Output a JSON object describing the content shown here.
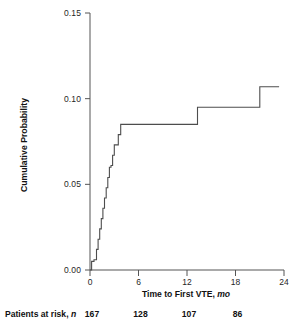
{
  "chart_data": {
    "type": "line",
    "subtype": "kaplan-meier-cumulative-incidence",
    "title": "",
    "xlabel": "Time to First VTE, mo",
    "xlabel_main": "Time to First VTE,",
    "xlabel_unit": "mo",
    "ylabel": "Cumulative Probability",
    "xlim": [
      0,
      24
    ],
    "ylim": [
      0.0,
      0.15
    ],
    "xticks": [
      0,
      6,
      12,
      18,
      24
    ],
    "xticklabels": [
      "0",
      "6",
      "12",
      "18",
      "24"
    ],
    "yticks": [
      0.0,
      0.05,
      0.1,
      0.15
    ],
    "yticklabels": [
      "0.00",
      "0.05",
      "0.10",
      "0.15"
    ],
    "grid": false,
    "legend": false,
    "line_color": "#4d4d4d",
    "axis_color": "#555555",
    "step_mode": "post",
    "x": [
      0.0,
      0.2,
      0.3,
      0.5,
      0.8,
      1.0,
      1.2,
      1.4,
      1.6,
      1.8,
      2.0,
      2.2,
      2.4,
      2.6,
      2.8,
      3.0,
      3.2,
      3.5,
      3.8,
      4.0,
      13.3,
      21.0,
      23.4
    ],
    "values": [
      0.0,
      0.005,
      0.005,
      0.006,
      0.012,
      0.018,
      0.024,
      0.03,
      0.036,
      0.042,
      0.048,
      0.054,
      0.06,
      0.061,
      0.067,
      0.073,
      0.073,
      0.079,
      0.085,
      0.085,
      0.095,
      0.107,
      0.107
    ],
    "annotations": [
      {
        "label": "first plateau",
        "y": 0.085,
        "x_start": 4.0,
        "x_end": 13.3
      },
      {
        "label": "second plateau",
        "y": 0.095,
        "x_start": 13.3,
        "x_end": 21.0
      },
      {
        "label": "final plateau",
        "y": 0.107,
        "x_start": 21.0,
        "x_end": 23.4
      }
    ]
  },
  "risk_table": {
    "title_main": "Patients at risk,",
    "title_unit": "n",
    "times": [
      0,
      6,
      12,
      18
    ],
    "values": [
      "167",
      "128",
      "107",
      "86"
    ]
  }
}
